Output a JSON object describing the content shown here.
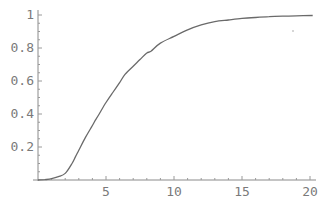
{
  "chart_data": {
    "type": "line",
    "title": "",
    "xlabel": "",
    "ylabel": "",
    "xlim": [
      0,
      20.3
    ],
    "ylim": [
      0,
      1.02
    ],
    "grid": false,
    "legend": null,
    "x_ticks": [
      5,
      10,
      15,
      20
    ],
    "x_tick_labels": [
      "5",
      "10",
      "15",
      "20"
    ],
    "y_ticks": [
      0.2,
      0.4,
      0.6,
      0.8,
      1
    ],
    "y_tick_labels": [
      "0.2",
      "0.4",
      "0.6",
      "0.8",
      "1"
    ],
    "series": [
      {
        "name": "curve",
        "color": "#6a6a6a",
        "x": [
          0,
          0.5,
          1,
          1.5,
          2,
          2.5,
          2.75,
          3,
          3.5,
          4,
          4.2,
          4.5,
          5,
          5.5,
          6,
          6.4,
          7,
          7.5,
          8,
          8.3,
          9,
          10,
          11,
          12,
          13,
          14,
          15,
          16,
          17,
          18,
          19,
          20.2
        ],
        "y": [
          0,
          0.002,
          0.008,
          0.02,
          0.04,
          0.1,
          0.14,
          0.18,
          0.26,
          0.33,
          0.36,
          0.4,
          0.47,
          0.53,
          0.59,
          0.64,
          0.69,
          0.73,
          0.77,
          0.78,
          0.83,
          0.87,
          0.91,
          0.94,
          0.96,
          0.97,
          0.98,
          0.985,
          0.99,
          0.993,
          0.995,
          0.997
        ]
      }
    ]
  },
  "plot_area": {
    "origin_px": [
      38,
      180
    ],
    "x_px_per_unit": 13.6,
    "y_px_per_unit": 165
  }
}
